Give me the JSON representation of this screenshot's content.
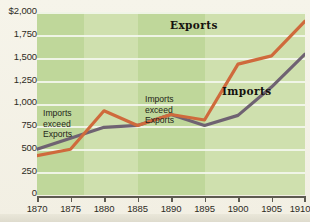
{
  "chart_data": {
    "type": "line",
    "title": "",
    "xlabel": "",
    "ylabel": "",
    "xlim": [
      1870,
      1910
    ],
    "ylim": [
      0,
      2000
    ],
    "grid": true,
    "legend_position": "inline-callout",
    "x": [
      1870,
      1875,
      1880,
      1885,
      1890,
      1895,
      1900,
      1905,
      1910
    ],
    "series": [
      {
        "name": "Exports",
        "color": "#cf6a3c",
        "values": [
          430,
          500,
          920,
          760,
          880,
          820,
          1430,
          1520,
          1900
        ]
      },
      {
        "name": "Imports",
        "color": "#6f6272",
        "values": [
          500,
          620,
          740,
          760,
          880,
          760,
          870,
          1180,
          1540
        ]
      }
    ],
    "y_ticks": [
      0,
      250,
      500,
      750,
      1000,
      1250,
      1500,
      1750,
      2000
    ],
    "y_tick_labels": [
      "0",
      "250",
      "500",
      "750",
      "1,000",
      "1,250",
      "1,500",
      "1,750",
      "$2,000"
    ],
    "x_ticks": [
      1870,
      1875,
      1880,
      1885,
      1890,
      1895,
      1900,
      1905,
      1910
    ],
    "x_tick_labels": [
      "1870",
      "1875",
      "1880",
      "1885",
      "1890",
      "1895",
      "1900",
      "1905",
      "1910"
    ],
    "annotations": [
      {
        "text": "Imports exceed Exports",
        "lines": [
          "Imports",
          "exceed",
          "Exports"
        ],
        "x_range": [
          1870,
          1877
        ]
      },
      {
        "text": "Imports exceed Exports",
        "lines": [
          "Imports",
          "exceed",
          "Exports"
        ],
        "x_range": [
          1885,
          1896
        ]
      }
    ],
    "series_callouts": [
      {
        "label": "Exports"
      },
      {
        "label": "Imports"
      }
    ],
    "colors": {
      "plot_background": "#cfe0ae",
      "band_background": "#bfd79a",
      "gridline": "#f3f6ec",
      "page_background": "#f4f2e8",
      "axis": "#5d5a50",
      "exports_line": "#cf6a3c",
      "imports_line": "#6f6272"
    }
  }
}
